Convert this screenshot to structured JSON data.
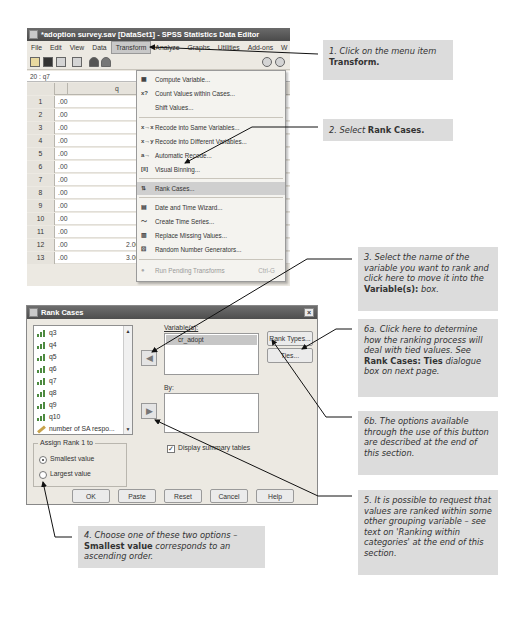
{
  "editor": {
    "title": "*adoption survey.sav [DataSet1] - SPSS Statistics Data Editor",
    "menu": [
      "File",
      "Edit",
      "View",
      "Data",
      "Transform",
      "Analyze",
      "Graphs",
      "Utilities",
      "Add-ons",
      "W"
    ],
    "active_menu": "Transform",
    "cell_ref": "20 : q7",
    "column_header_partial": "q",
    "rows": [
      {
        "num": "1",
        "c1": ".00",
        "c5": "3.00"
      },
      {
        "num": "2",
        "c1": ".00",
        "c5": "2.00"
      },
      {
        "num": "3",
        "c1": ".00",
        "c5": "1.00"
      },
      {
        "num": "4",
        "c1": ".00",
        "c5": "3.00"
      },
      {
        "num": "5",
        "c1": ".00",
        "c5": "4.00"
      },
      {
        "num": "6",
        "c1": ".00",
        "c5": "1.00"
      },
      {
        "num": "7",
        "c1": ".00",
        "c5": "1.00"
      },
      {
        "num": "8",
        "c1": ".00",
        "c5": "2.00"
      },
      {
        "num": "9",
        "c1": ".00",
        "c5": "1.00"
      },
      {
        "num": "10",
        "c1": ".00",
        "c5": "2.00"
      },
      {
        "num": "11",
        "c1": ".00",
        "c5": "5.00"
      },
      {
        "num": "12",
        "c1": ".00",
        "c2": "2.00",
        "c3": "4.00",
        "c4": "3.00",
        "c5": "4.00"
      },
      {
        "num": "13",
        "c1": ".00",
        "c2": "3.00",
        "c3": "2.00",
        "c4": "3.00",
        "c5": "3.00"
      }
    ],
    "transform_menu": {
      "items": [
        {
          "label": "Compute Variable...",
          "icon": "calculator-icon",
          "glyph": "▦"
        },
        {
          "label": "Count Values within Cases...",
          "icon": "count-icon",
          "glyph": "x?"
        },
        {
          "label": "Shift Values...",
          "icon": "",
          "glyph": ""
        },
        {
          "label": "Recode into Same Variables...",
          "icon": "recode-same-icon",
          "glyph": "x→x"
        },
        {
          "label": "Recode into Different Variables...",
          "icon": "recode-different-icon",
          "glyph": "x→y"
        },
        {
          "label": "Automatic Recode...",
          "icon": "automatic-recode-icon",
          "glyph": "a→"
        },
        {
          "label": "Visual Binning...",
          "icon": "binning-icon",
          "glyph": "[‖]"
        },
        {
          "label": "Rank Cases...",
          "icon": "rank-icon",
          "glyph": "⇅"
        },
        {
          "label": "Date and Time Wizard...",
          "icon": "calendar-icon",
          "glyph": "▤"
        },
        {
          "label": "Create Time Series...",
          "icon": "time-series-icon",
          "glyph": "〜"
        },
        {
          "label": "Replace Missing Values...",
          "icon": "replace-missing-icon",
          "glyph": "▥"
        },
        {
          "label": "Random Number Generators...",
          "icon": "dice-icon",
          "glyph": "⚄"
        },
        {
          "label": "Run Pending Transforms",
          "icon": "run-icon",
          "glyph": "●",
          "shortcut": "Ctrl-G",
          "disabled": true
        }
      ],
      "selected": "Rank Cases..."
    }
  },
  "dialog": {
    "title": "Rank Cases",
    "variables_list": [
      "q3",
      "q4",
      "q5",
      "q6",
      "q7",
      "q8",
      "q9",
      "q10",
      "number of SA respo..."
    ],
    "variables_label": "Variable(s):",
    "selected_variable": "cr_adopt",
    "by_label": "By:",
    "rank_types_button": "Rank Types...",
    "ties_button": "Ties...",
    "assign_rank_group": "Assign Rank 1 to",
    "radio_smallest": "Smallest value",
    "radio_largest": "Largest value",
    "smallest_checked": true,
    "display_summary_label": "Display summary tables",
    "display_summary_checked": true,
    "buttons": [
      "OK",
      "Paste",
      "Reset",
      "Cancel",
      "Help"
    ]
  },
  "callouts": {
    "c1_text": "1. Click on the menu item ",
    "c1_bold": "Transform.",
    "c2_text": "2. Select ",
    "c2_bold": "Rank Cases.",
    "c3_text": "3. Select the name of the variable you want to rank and click here to move it into the ",
    "c3_bold": "Variable(s):",
    "c3_tail": " box.",
    "c6a_text": "6a. Click here to determine how the ranking process will deal with tied values. See ",
    "c6a_bold": "Rank Cases: Ties",
    "c6a_tail": " dialogue box on next page.",
    "c6b_text": "6b. The options available through the use of this button are described at the end of this section.",
    "c5_text": "5. It is possible to request that values are ranked within some other grouping variable – see text on 'Ranking within categories' at the end of this section.",
    "c4_text": "4. Choose one of these two options – ",
    "c4_bold": "Smallest value",
    "c4_tail": " corresponds to an ascending order."
  }
}
